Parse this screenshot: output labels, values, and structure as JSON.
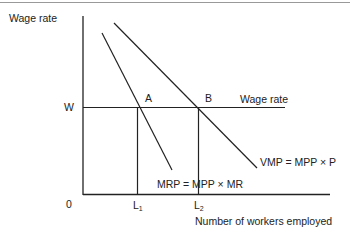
{
  "diagram": {
    "type": "labor market marginal product diagram",
    "y_axis_label": "Wage rate",
    "x_axis_label": "Number of workers employed",
    "origin_label": "0",
    "wage_level_label": "W",
    "wage_line_label": "Wage rate",
    "points": [
      {
        "label": "A",
        "x": 137,
        "y": 107
      },
      {
        "label": "B",
        "x": 198,
        "y": 107
      }
    ],
    "x_ticks": [
      {
        "label": "L",
        "sub": "1",
        "x": 137
      },
      {
        "label": "L",
        "sub": "2",
        "x": 198
      }
    ],
    "curves": [
      {
        "name": "MRP",
        "label": "MRP = MPP × MR",
        "x1": 102,
        "y1": 33,
        "x2": 172,
        "y2": 170
      },
      {
        "name": "VMP",
        "label": "VMP = MPP × P",
        "x1": 114,
        "y1": 23,
        "x2": 257,
        "y2": 168
      }
    ],
    "colors": {
      "line": "#222222",
      "text": "#222222"
    }
  }
}
